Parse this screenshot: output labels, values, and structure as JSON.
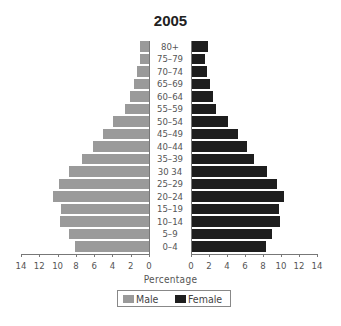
{
  "chart_data": {
    "type": "bar",
    "subtype": "population-pyramid",
    "title": "2005",
    "xlabel": "Percentage",
    "ylabel": "",
    "categories": [
      "80+",
      "75–79",
      "70–74",
      "65–69",
      "60–64",
      "55–59",
      "50–54",
      "45–49",
      "40–44",
      "35–39",
      "30 34",
      "25–29",
      "20–24",
      "15–19",
      "10–14",
      "5–9",
      "0–4"
    ],
    "series": [
      {
        "name": "Male",
        "color": "#9a9a9a",
        "side": "left",
        "values": [
          1.0,
          1.0,
          1.3,
          1.6,
          2.1,
          2.6,
          3.9,
          5.0,
          6.1,
          7.3,
          8.8,
          9.8,
          10.5,
          9.6,
          9.7,
          8.8,
          8.1
        ]
      },
      {
        "name": "Female",
        "color": "#1e1e1e",
        "side": "right",
        "values": [
          1.9,
          1.5,
          1.8,
          2.1,
          2.4,
          2.8,
          4.1,
          5.2,
          6.2,
          7.0,
          8.4,
          9.6,
          10.3,
          9.8,
          9.9,
          9.0,
          8.3
        ]
      }
    ],
    "xlim": [
      0,
      14
    ],
    "x_ticks_left": [
      "14",
      "12",
      "10",
      "8",
      "6",
      "4",
      "2",
      "0"
    ],
    "x_ticks_right": [
      "0",
      "2",
      "4",
      "6",
      "8",
      "10",
      "12",
      "14"
    ],
    "grid": false,
    "legend_position": "bottom-center"
  },
  "legend": {
    "male_label": "Male",
    "female_label": "Female"
  }
}
